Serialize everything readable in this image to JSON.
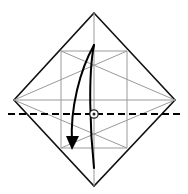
{
  "figure": {
    "kind": "origami-step-diagram",
    "title": "",
    "caption": "",
    "width": 188,
    "height": 194,
    "background_color": "#ffffff"
  },
  "colors": {
    "paper_edge": "#111111",
    "existing_crease": "#9a9a9a",
    "fold_line": "#000000",
    "arrow": "#000000",
    "marker_outline": "#222222",
    "marker_fill": "#ffffff",
    "paper_face": "#ffffff"
  },
  "geometry": {
    "vertices": {
      "top": [
        94,
        13
      ],
      "left": [
        14,
        100
      ],
      "right": [
        175,
        100
      ],
      "bottom": [
        94,
        186
      ],
      "center": [
        94,
        100
      ]
    }
  },
  "sheet": {
    "shape": "diamond",
    "outline_points": "94,13 175,100 94,186 14,100",
    "stroke_width": 1.6
  },
  "creases": [
    {
      "name": "vertical-center-crease",
      "x1": 94,
      "y1": 13,
      "x2": 94,
      "y2": 186
    },
    {
      "name": "vertical-left-crease",
      "x1": 61,
      "y1": 51,
      "x2": 61,
      "y2": 148
    },
    {
      "name": "vertical-right-crease",
      "x1": 127,
      "y1": 51,
      "x2": 127,
      "y2": 148
    },
    {
      "name": "horizontal-upper-crease",
      "x1": 61,
      "y1": 51,
      "x2": 127,
      "y2": 51
    },
    {
      "name": "horizontal-lower-crease",
      "x1": 61,
      "y1": 148,
      "x2": 127,
      "y2": 148
    },
    {
      "name": "horizontal-middle-crease",
      "x1": 14,
      "y1": 100,
      "x2": 175,
      "y2": 100
    },
    {
      "name": "diagonal-left-up",
      "x1": 14,
      "y1": 100,
      "x2": 127,
      "y2": 51
    },
    {
      "name": "diagonal-right-up",
      "x1": 175,
      "y1": 100,
      "x2": 61,
      "y2": 51
    },
    {
      "name": "diagonal-left-down",
      "x1": 14,
      "y1": 100,
      "x2": 127,
      "y2": 148
    },
    {
      "name": "diagonal-right-down",
      "x1": 175,
      "y1": 100,
      "x2": 61,
      "y2": 148
    }
  ],
  "fold_line": {
    "name": "valley-fold-line",
    "style": "dashed",
    "x1": 8,
    "y1": 114,
    "x2": 180,
    "y2": 114,
    "dash_pattern": "7 4",
    "stroke_width": 1.8
  },
  "center_marker": {
    "name": "reference-point-marker",
    "cx": 94,
    "cy": 114,
    "outer_radius": 4.2,
    "inner_radius": 1.5
  },
  "arrow": {
    "name": "fold-and-unfold-arrow",
    "type": "fold-then-unfold",
    "outbound_path": "M 94,45 C 80,70 70,108 72,143",
    "return_path": "M 94,45 C 88,75 90,130 94,168",
    "stroke_width": 2.0,
    "head": {
      "tip": [
        72,
        150
      ],
      "left": [
        66,
        136
      ],
      "right": [
        79,
        136
      ]
    }
  }
}
